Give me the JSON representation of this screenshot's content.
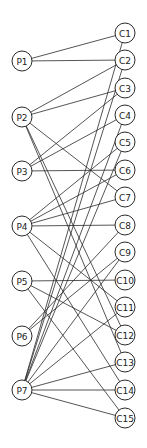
{
  "diagram": {
    "type": "bipartite-graph",
    "left_nodes": [
      {
        "id": "P1",
        "label": "P1",
        "x": 22,
        "y": 61
      },
      {
        "id": "P2",
        "label": "P2",
        "x": 22,
        "y": 117
      },
      {
        "id": "P3",
        "label": "P3",
        "x": 22,
        "y": 171
      },
      {
        "id": "P4",
        "label": "P4",
        "x": 22,
        "y": 226
      },
      {
        "id": "P5",
        "label": "P5",
        "x": 22,
        "y": 281
      },
      {
        "id": "P6",
        "label": "P6",
        "x": 22,
        "y": 336
      },
      {
        "id": "P7",
        "label": "P7",
        "x": 22,
        "y": 390
      }
    ],
    "right_nodes": [
      {
        "id": "C1",
        "label": "C1",
        "x": 125,
        "y": 33
      },
      {
        "id": "C2",
        "label": "C2",
        "x": 125,
        "y": 60
      },
      {
        "id": "C3",
        "label": "C3",
        "x": 125,
        "y": 88
      },
      {
        "id": "C4",
        "label": "C4",
        "x": 125,
        "y": 115
      },
      {
        "id": "C5",
        "label": "C5",
        "x": 125,
        "y": 142
      },
      {
        "id": "C6",
        "label": "C6",
        "x": 125,
        "y": 170
      },
      {
        "id": "C7",
        "label": "C7",
        "x": 125,
        "y": 197
      },
      {
        "id": "C8",
        "label": "C8",
        "x": 125,
        "y": 225
      },
      {
        "id": "C9",
        "label": "C9",
        "x": 125,
        "y": 252
      },
      {
        "id": "C10",
        "label": "C10",
        "x": 125,
        "y": 280
      },
      {
        "id": "C11",
        "label": "C11",
        "x": 125,
        "y": 307
      },
      {
        "id": "C12",
        "label": "C12",
        "x": 125,
        "y": 335
      },
      {
        "id": "C13",
        "label": "C13",
        "x": 125,
        "y": 362
      },
      {
        "id": "C14",
        "label": "C14",
        "x": 125,
        "y": 390
      },
      {
        "id": "C15",
        "label": "C15",
        "x": 125,
        "y": 418
      }
    ],
    "edges": [
      [
        "P1",
        "C1"
      ],
      [
        "P1",
        "C2"
      ],
      [
        "P2",
        "C2"
      ],
      [
        "P2",
        "C3"
      ],
      [
        "P2",
        "C7"
      ],
      [
        "P2",
        "C12"
      ],
      [
        "P2",
        "C13"
      ],
      [
        "P3",
        "C3"
      ],
      [
        "P3",
        "C4"
      ],
      [
        "P3",
        "C6"
      ],
      [
        "P4",
        "C5"
      ],
      [
        "P4",
        "C6"
      ],
      [
        "P4",
        "C7"
      ],
      [
        "P4",
        "C8"
      ],
      [
        "P4",
        "C11"
      ],
      [
        "P4",
        "C14"
      ],
      [
        "P5",
        "C10"
      ],
      [
        "P5",
        "C12"
      ],
      [
        "P5",
        "C15"
      ],
      [
        "P6",
        "C8"
      ],
      [
        "P6",
        "C9"
      ],
      [
        "P7",
        "C1"
      ],
      [
        "P7",
        "C2"
      ],
      [
        "P7",
        "C4"
      ],
      [
        "P7",
        "C5"
      ],
      [
        "P7",
        "C9"
      ],
      [
        "P7",
        "C11"
      ],
      [
        "P7",
        "C13"
      ],
      [
        "P7",
        "C14"
      ],
      [
        "P7",
        "C15"
      ]
    ],
    "node_radius": 10,
    "colors": {
      "stroke": "#2a2a2a",
      "background": "#ffffff"
    }
  }
}
